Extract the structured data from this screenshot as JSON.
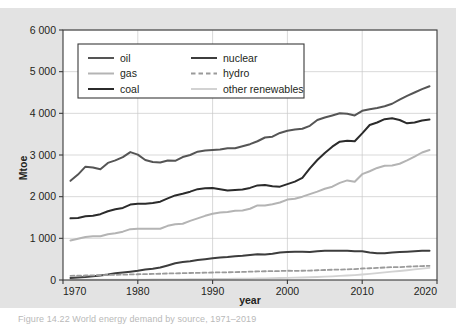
{
  "figure": {
    "background_color": "#e3e3e3",
    "plot_background_color": "#ffffff",
    "frame_color": "#3a3a3a"
  },
  "caption": {
    "text": "Figure 14.22 World energy demand by source, 1971–2019"
  },
  "axes": {
    "y_title": "Mtoe",
    "x_title": "year",
    "y_ticks": [
      "0",
      "1 000",
      "2 000",
      "3 000",
      "4 000",
      "5 000",
      "6 000"
    ],
    "x_ticks": [
      "1970",
      "1980",
      "1990",
      "2000",
      "2010",
      "2020"
    ]
  },
  "legend": {
    "items": [
      {
        "label": "oil",
        "color": "#555555",
        "dash": "solid",
        "width": 2.0
      },
      {
        "label": "nuclear",
        "color": "#3d3d3d",
        "dash": "solid",
        "width": 2.0
      },
      {
        "label": "gas",
        "color": "#b4b4b4",
        "dash": "solid",
        "width": 2.0
      },
      {
        "label": "hydro",
        "color": "#9a9a9a",
        "dash": "dashed",
        "width": 2.0
      },
      {
        "label": "coal",
        "color": "#2b2b2b",
        "dash": "solid",
        "width": 2.0
      },
      {
        "label": "other renewables",
        "color": "#d2d2d2",
        "dash": "solid",
        "width": 2.0
      }
    ]
  },
  "chart_data": {
    "type": "line",
    "title": "",
    "xlabel": "year",
    "ylabel": "Mtoe",
    "xlim": [
      1970,
      2020
    ],
    "ylim": [
      0,
      6000
    ],
    "grid": true,
    "legend_position": "top-left-inside",
    "x": [
      1971,
      1972,
      1973,
      1974,
      1975,
      1976,
      1977,
      1978,
      1979,
      1980,
      1981,
      1982,
      1983,
      1984,
      1985,
      1986,
      1987,
      1988,
      1989,
      1990,
      1991,
      1992,
      1993,
      1994,
      1995,
      1996,
      1997,
      1998,
      1999,
      2000,
      2001,
      2002,
      2003,
      2004,
      2005,
      2006,
      2007,
      2008,
      2009,
      2010,
      2011,
      2012,
      2013,
      2014,
      2015,
      2016,
      2017,
      2018,
      2019
    ],
    "series": [
      {
        "name": "oil",
        "color": "#555555",
        "dash": "solid",
        "values": [
          2380,
          2530,
          2720,
          2700,
          2660,
          2810,
          2870,
          2950,
          3070,
          3010,
          2880,
          2830,
          2820,
          2870,
          2860,
          2950,
          3000,
          3080,
          3110,
          3120,
          3130,
          3160,
          3160,
          3210,
          3260,
          3330,
          3420,
          3440,
          3530,
          3580,
          3610,
          3630,
          3700,
          3840,
          3900,
          3950,
          4000,
          3990,
          3950,
          4060,
          4100,
          4130,
          4170,
          4230,
          4330,
          4420,
          4500,
          4580,
          4650
        ]
      },
      {
        "name": "coal",
        "color": "#2b2b2b",
        "dash": "solid",
        "values": [
          1480,
          1490,
          1530,
          1540,
          1580,
          1650,
          1700,
          1730,
          1810,
          1830,
          1830,
          1850,
          1880,
          1960,
          2030,
          2070,
          2120,
          2180,
          2200,
          2210,
          2180,
          2150,
          2160,
          2170,
          2210,
          2270,
          2280,
          2250,
          2240,
          2300,
          2360,
          2450,
          2680,
          2880,
          3050,
          3200,
          3320,
          3340,
          3330,
          3520,
          3720,
          3780,
          3860,
          3880,
          3840,
          3760,
          3780,
          3830,
          3850
        ]
      },
      {
        "name": "gas",
        "color": "#b4b4b4",
        "dash": "solid",
        "values": [
          950,
          990,
          1030,
          1050,
          1050,
          1100,
          1120,
          1160,
          1220,
          1230,
          1230,
          1230,
          1230,
          1300,
          1340,
          1350,
          1420,
          1480,
          1540,
          1590,
          1620,
          1630,
          1660,
          1670,
          1710,
          1790,
          1790,
          1820,
          1860,
          1930,
          1950,
          2000,
          2060,
          2120,
          2190,
          2240,
          2330,
          2390,
          2360,
          2540,
          2610,
          2690,
          2740,
          2750,
          2790,
          2870,
          2960,
          3060,
          3120
        ]
      },
      {
        "name": "nuclear",
        "color": "#3d3d3d",
        "dash": "solid",
        "values": [
          50,
          60,
          70,
          90,
          110,
          130,
          160,
          180,
          200,
          220,
          250,
          270,
          300,
          350,
          400,
          430,
          450,
          480,
          500,
          520,
          540,
          550,
          570,
          580,
          600,
          620,
          610,
          630,
          660,
          670,
          680,
          680,
          670,
          690,
          700,
          700,
          700,
          700,
          690,
          690,
          660,
          640,
          640,
          660,
          670,
          680,
          690,
          700,
          700
        ]
      },
      {
        "name": "hydro",
        "color": "#9a9a9a",
        "dash": "dashed",
        "values": [
          100,
          105,
          108,
          112,
          118,
          120,
          124,
          128,
          133,
          138,
          142,
          146,
          150,
          157,
          160,
          164,
          168,
          172,
          175,
          180,
          183,
          185,
          190,
          194,
          200,
          206,
          210,
          212,
          215,
          222,
          220,
          222,
          226,
          234,
          240,
          246,
          250,
          256,
          262,
          276,
          282,
          290,
          300,
          308,
          310,
          320,
          328,
          334,
          340
        ]
      },
      {
        "name": "other renewables",
        "color": "#d2d2d2",
        "dash": "solid",
        "values": [
          5,
          5,
          6,
          6,
          7,
          7,
          8,
          8,
          9,
          10,
          11,
          12,
          13,
          15,
          16,
          17,
          18,
          20,
          22,
          24,
          26,
          28,
          30,
          32,
          35,
          38,
          41,
          44,
          48,
          52,
          56,
          60,
          66,
          72,
          80,
          88,
          98,
          108,
          118,
          132,
          148,
          164,
          182,
          200,
          216,
          234,
          254,
          274,
          292
        ]
      }
    ]
  }
}
